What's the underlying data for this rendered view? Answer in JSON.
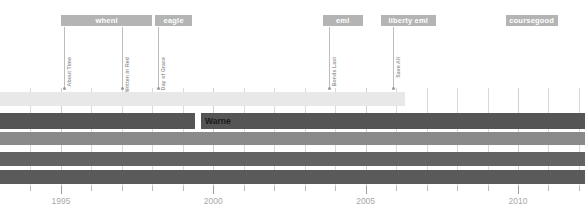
{
  "chart_data": {
    "type": "bar",
    "title": "",
    "xlabel": "",
    "ylabel": "",
    "xlim": [
      1993.0,
      2012.2
    ],
    "grid": true,
    "legend_position": "none",
    "axis": {
      "tick_labels": [
        "1995",
        "2000",
        "2005",
        "2010"
      ],
      "tick_values": [
        1995,
        2000,
        2005,
        2010
      ],
      "minor_ticks": [
        1994,
        1996,
        1997,
        1998,
        1999,
        2001,
        2002,
        2003,
        2004,
        2006,
        2007,
        2008,
        2009,
        2011,
        2012
      ]
    },
    "era_bands": [
      {
        "label": "whenl",
        "start": 1995.0,
        "end": 1998.0
      },
      {
        "label": "eagle",
        "start": 1998.1,
        "end": 1999.3
      },
      {
        "label": "eml",
        "start": 2003.6,
        "end": 2004.9
      },
      {
        "label": "liberty eml",
        "start": 2005.5,
        "end": 2007.3
      },
      {
        "label": "coursegood",
        "start": 2009.6,
        "end": 2011.3
      }
    ],
    "events": [
      {
        "label": "About Time",
        "year": 1995.1
      },
      {
        "label": "Written in Red",
        "year": 1997.0
      },
      {
        "label": "Day of Grace",
        "year": 1998.2
      },
      {
        "label": "Bonds Last",
        "year": 2003.8
      },
      {
        "label": "Save All",
        "year": 2005.9
      }
    ],
    "series": [
      {
        "name": "row-1",
        "color": "#e8e8e8",
        "segments": [
          {
            "start": 1993.0,
            "end": 2006.3
          }
        ]
      },
      {
        "name": "row-2",
        "color": "#555555",
        "label": "Warne",
        "segments": [
          {
            "start": 1993.0,
            "end": 1999.4
          },
          {
            "start": 1999.6,
            "end": 2012.2
          }
        ]
      },
      {
        "name": "row-3",
        "color": "#8a8a8a",
        "segments": [
          {
            "start": 1993.0,
            "end": 2012.2
          }
        ]
      },
      {
        "name": "row-4",
        "color": "#636363",
        "segments": [
          {
            "start": 1993.0,
            "end": 2012.2
          }
        ]
      },
      {
        "name": "row-5",
        "color": "#5a5a5a",
        "segments": [
          {
            "start": 1993.0,
            "end": 2012.2
          }
        ]
      }
    ]
  },
  "colors": {
    "band": "#b4b4b4",
    "band_text": "#ffffff",
    "event_stem": "#bdbdbd",
    "event_text": "#9a9a9a",
    "axis_text": "#a8a8a8",
    "gridline": "#d9d9d9",
    "background": "#ffffff"
  }
}
